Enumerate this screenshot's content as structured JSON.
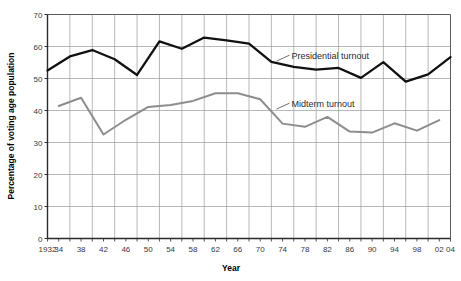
{
  "chart_data": {
    "type": "line",
    "title": "",
    "xlabel": "Year",
    "ylabel": "Percentage of voting age population",
    "xlim": [
      1932,
      2004
    ],
    "ylim": [
      0,
      70
    ],
    "grid": true,
    "legend_position": "inline-annotation",
    "y_ticks": [
      0,
      10,
      20,
      30,
      40,
      50,
      60,
      70
    ],
    "y_tick_labels": [
      "0",
      "10",
      "20",
      "30",
      "40",
      "50",
      "60",
      "70"
    ],
    "x_tick_labels": [
      "1932",
      "34",
      "38",
      "42",
      "46",
      "50",
      "54",
      "58",
      "62",
      "66",
      "70",
      "74",
      "78",
      "82",
      "86",
      "90",
      "94",
      "98",
      "02",
      "04"
    ],
    "x_tick_years": [
      1932,
      1934,
      1938,
      1942,
      1946,
      1950,
      1954,
      1958,
      1962,
      1966,
      1970,
      1974,
      1978,
      1982,
      1986,
      1990,
      1994,
      1998,
      2002,
      2004
    ],
    "annotations": [
      {
        "text": "Presidential turnout",
        "x": 1974,
        "y": 57
      },
      {
        "text": "Midterm turnout",
        "x": 1974,
        "y": 42
      }
    ],
    "series": [
      {
        "name": "Presidential turnout",
        "color": "#111111",
        "x": [
          1932,
          1936,
          1940,
          1944,
          1948,
          1952,
          1956,
          1960,
          1964,
          1968,
          1972,
          1976,
          1980,
          1984,
          1988,
          1992,
          1996,
          2000,
          2004
        ],
        "values": [
          52.5,
          56.9,
          58.9,
          56.0,
          51.1,
          61.6,
          59.3,
          62.8,
          61.9,
          60.9,
          55.2,
          53.6,
          52.8,
          53.3,
          50.2,
          55.1,
          49.0,
          51.3,
          56.7
        ]
      },
      {
        "name": "Midterm turnout",
        "color": "#8d8d8d",
        "x": [
          1934,
          1938,
          1942,
          1946,
          1950,
          1954,
          1958,
          1962,
          1966,
          1970,
          1974,
          1978,
          1982,
          1986,
          1990,
          1994,
          1998,
          2002
        ],
        "values": [
          41.4,
          44.0,
          32.5,
          37.1,
          41.1,
          41.7,
          43.0,
          45.4,
          45.4,
          43.5,
          35.9,
          34.9,
          38.0,
          33.4,
          33.1,
          36.0,
          33.7,
          37.0
        ]
      }
    ]
  },
  "axis": {
    "x_title": "Year",
    "y_title": "Percentage of voting age population"
  }
}
